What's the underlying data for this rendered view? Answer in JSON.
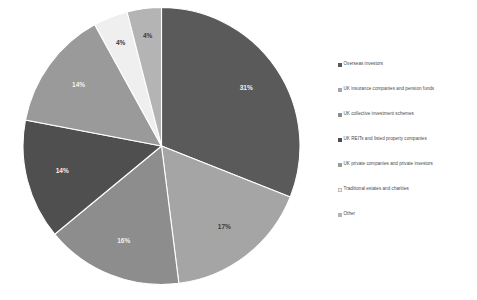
{
  "chart_data": {
    "type": "pie",
    "title": "",
    "categories": [
      "Overseas investors",
      "UK insurance companies and pension funds",
      "UK collective investment schemes",
      "UK REITs and listed property companies",
      "UK private companies and private investors",
      "Traditional estates and charities",
      "Other"
    ],
    "values": [
      31,
      17,
      16,
      14,
      14,
      4,
      4
    ],
    "data_labels": [
      "31%",
      "17%",
      "16%",
      "14%",
      "14%",
      "4%",
      "4%"
    ],
    "colors": [
      "#5a5a5a",
      "#a5a5a5",
      "#8d8d8d",
      "#4f4f4f",
      "#9a9a9a",
      "#efefef",
      "#b4b4b4"
    ],
    "label_colors": [
      "#f2f2f2",
      "#3b3b3b",
      "#f2f2f2",
      "#f2f2f2",
      "#f2f2f2",
      "#3b3b3b",
      "#3b3b3b"
    ],
    "start_angle": 0,
    "direction": "clockwise",
    "legend_position": "right",
    "grid": false,
    "xlabel": "",
    "ylabel": ""
  },
  "legend": {
    "items": [
      {
        "label": "Overseas investors",
        "color": "#5a5a5a"
      },
      {
        "label": "UK insurance companies and pension funds",
        "color": "#a5a5a5"
      },
      {
        "label": "UK collective investment schemes",
        "color": "#8d8d8d"
      },
      {
        "label": "UK REITs and listed property companies",
        "color": "#4f4f4f"
      },
      {
        "label": "UK private companies and private investors",
        "color": "#9a9a9a"
      },
      {
        "label": "Traditional estates and charities",
        "color": "#efefef"
      },
      {
        "label": "Other",
        "color": "#b4b4b4"
      }
    ]
  },
  "top_bleed": {
    "text": "· · · · ·"
  }
}
